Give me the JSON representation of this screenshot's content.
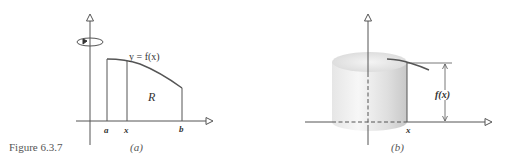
{
  "figure": {
    "caption": "Figure 6.3.7",
    "panels": [
      {
        "id": "a",
        "label": "(a)",
        "curve_label": "y = f(x)",
        "region_label": "R",
        "x_ticks": [
          "a",
          "x",
          "b"
        ],
        "rotation_indicator": "rotation-about-y-axis"
      },
      {
        "id": "b",
        "label": "(b)",
        "height_label": "f(x)",
        "x_tick": "x",
        "solid": "cylindrical-shell"
      }
    ]
  },
  "colors": {
    "line": "#555555",
    "text": "#333333",
    "caption": "#555555",
    "shell_light": "#f2f2f2",
    "shell_dark": "#cfcfcf"
  }
}
